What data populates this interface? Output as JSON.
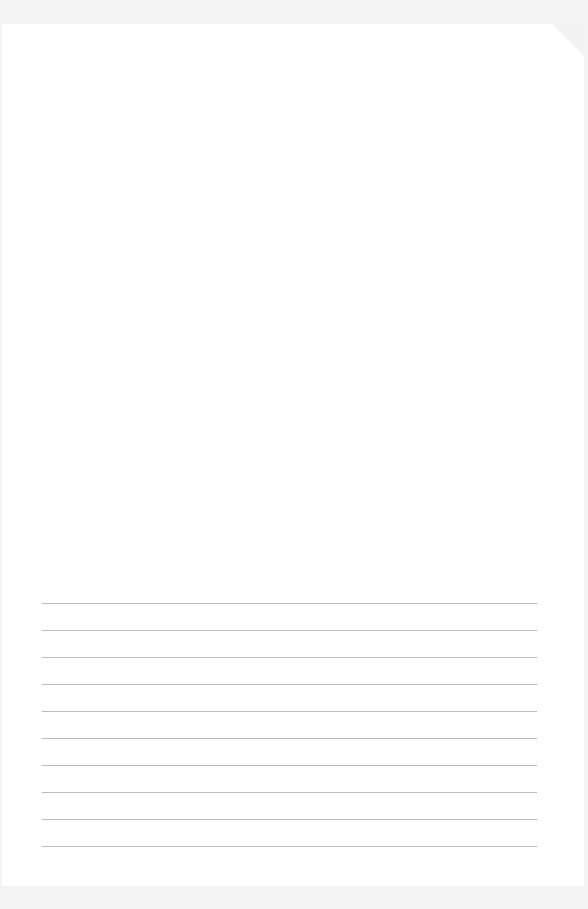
{
  "document": {
    "type": "ruled-writing-sheet",
    "ruled_line_count": 10,
    "line_color": "#bdbdbd",
    "page_color": "#ffffff",
    "background_color": "#f4f4f4"
  },
  "lines": [
    "",
    "",
    "",
    "",
    "",
    "",
    "",
    "",
    "",
    ""
  ]
}
